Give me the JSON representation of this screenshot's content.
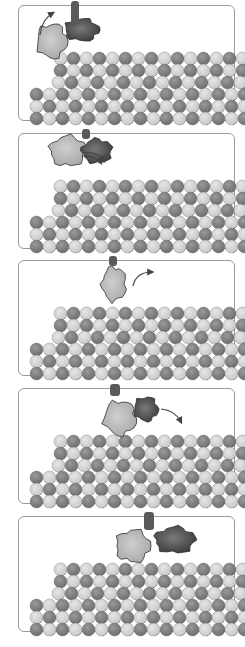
{
  "figure": {
    "title": "",
    "colors": {
      "background": "#ffffff",
      "panel_border": "#9a9a9a",
      "tubulin_light": "#c8c8c8",
      "tubulin_dark": "#6e6e6e",
      "motor_head_light": "#a8a8a8",
      "motor_head_dark": "#3c3c3c",
      "arrow": "#444444"
    },
    "microtubule": {
      "rows": 6,
      "sphere_diameter": 13,
      "columns": 15
    },
    "panels": [
      {
        "index": 1,
        "top": 5,
        "arrow": "curved-up-left",
        "heads": [
          "light-left-rising",
          "dark-right-bound"
        ]
      },
      {
        "index": 2,
        "top": 133,
        "arrow": "double-curve-forward",
        "heads": [
          "light-left-bound",
          "dark-right-raised"
        ]
      },
      {
        "index": 3,
        "top": 260,
        "arrow": "curved-up-right",
        "heads": [
          "single-combined"
        ]
      },
      {
        "index": 4,
        "top": 388,
        "arrow": "curved-down-right",
        "heads": [
          "light-left-bound",
          "dark-right-swinging"
        ]
      },
      {
        "index": 5,
        "top": 516,
        "arrow": "none",
        "heads": [
          "light-left-bound",
          "dark-right-bound"
        ]
      }
    ]
  }
}
